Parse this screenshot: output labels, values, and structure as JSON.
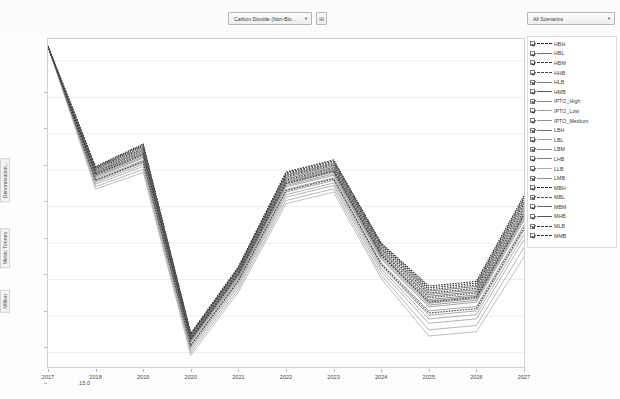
{
  "toolbar": {
    "dimension_filter": {
      "value": "Carbon Dioxide (Non-Biogenic)",
      "caret": "▼"
    },
    "dimension_button": {
      "icon": "⊞",
      "label": "filter-grid-button"
    },
    "scenario_filter": {
      "value": "All Scenarios",
      "caret": "▼"
    }
  },
  "chart_data": {
    "type": "line",
    "title": "",
    "xlabel": "",
    "ylabel": "Million | Metric Tonnes | Denomination...",
    "ylabel_parts": [
      "Denomination...",
      "Metric Tonnes",
      "Million"
    ],
    "x": [
      2017,
      2018,
      2019,
      2020,
      2021,
      2022,
      2023,
      2024,
      2025,
      2026,
      2027
    ],
    "xticks": [
      "2017",
      "2018",
      "2019",
      "2020",
      "2021",
      "2022",
      "2023",
      "2024",
      "2025",
      "2026",
      "2027"
    ],
    "yticks": [
      "15.0",
      "16.0",
      "17.0",
      "18.0",
      "19.0",
      "20.0",
      "21.0",
      "22.0",
      "23.0"
    ],
    "ylim": [
      14.6,
      23.6
    ],
    "xlim": [
      2017,
      2027
    ],
    "grid": true,
    "legend_position": "right",
    "series": [
      {
        "name": "HBH",
        "dash": "dotted",
        "color": "#2b2b2b",
        "values": [
          23.4,
          20.1,
          20.72,
          15.52,
          17.35,
          19.95,
          20.28,
          18.0,
          16.82,
          16.95,
          19.3
        ]
      },
      {
        "name": "HBL",
        "dash": "solid",
        "color": "#6f6f6f",
        "values": [
          23.4,
          19.92,
          20.48,
          15.38,
          17.18,
          19.7,
          20.02,
          17.72,
          16.45,
          16.58,
          18.85
        ]
      },
      {
        "name": "HBM",
        "dash": "dotted",
        "color": "#3a3a3a",
        "values": [
          23.4,
          20.02,
          20.6,
          15.45,
          17.27,
          19.83,
          20.15,
          17.86,
          16.63,
          16.76,
          19.08
        ]
      },
      {
        "name": "HHB",
        "dash": "dotted",
        "color": "#444444",
        "values": [
          23.4,
          20.06,
          20.66,
          15.49,
          17.31,
          19.89,
          20.21,
          17.93,
          16.72,
          16.85,
          19.18
        ]
      },
      {
        "name": "HLB",
        "dash": "solid",
        "color": "#7a7a7a",
        "values": [
          23.4,
          19.86,
          20.4,
          15.33,
          17.12,
          19.62,
          19.95,
          17.64,
          16.35,
          16.48,
          18.74
        ]
      },
      {
        "name": "HMB",
        "dash": "solid",
        "color": "#5a5a5a",
        "values": [
          23.4,
          19.96,
          20.54,
          15.41,
          17.22,
          19.76,
          20.08,
          17.79,
          16.54,
          16.67,
          18.96
        ]
      },
      {
        "name": "IPTO_High",
        "dash": "solid",
        "color": "#8a8a8a",
        "values": [
          23.4,
          19.8,
          20.33,
          15.28,
          17.05,
          19.54,
          19.86,
          17.55,
          16.25,
          16.38,
          18.62
        ]
      },
      {
        "name": "IPTO_Low",
        "dash": "solid",
        "color": "#9a9a9a",
        "values": [
          23.4,
          19.62,
          20.1,
          15.06,
          16.82,
          19.26,
          19.58,
          17.22,
          15.8,
          15.92,
          18.1
        ]
      },
      {
        "name": "IPTO_Medium",
        "dash": "solid",
        "color": "#909090",
        "values": [
          23.4,
          19.71,
          20.21,
          15.17,
          16.94,
          19.4,
          19.72,
          17.38,
          16.02,
          16.14,
          18.36
        ]
      },
      {
        "name": "LBH",
        "dash": "solid",
        "color": "#6a6a6a",
        "values": [
          23.4,
          19.9,
          20.45,
          15.36,
          17.16,
          19.67,
          19.99,
          17.69,
          16.41,
          16.54,
          18.8
        ]
      },
      {
        "name": "LBL",
        "dash": "solid",
        "color": "#9e9e9e",
        "values": [
          23.4,
          19.55,
          20.02,
          14.99,
          16.74,
          19.17,
          19.49,
          17.12,
          15.62,
          15.74,
          17.88
        ]
      },
      {
        "name": "LBM",
        "dash": "solid",
        "color": "#888888",
        "values": [
          23.4,
          19.76,
          20.27,
          15.22,
          17.0,
          19.47,
          19.79,
          17.46,
          16.14,
          16.26,
          18.49
        ]
      },
      {
        "name": "LHB",
        "dash": "solid",
        "color": "#7e7e7e",
        "values": [
          23.4,
          19.83,
          20.36,
          15.3,
          17.08,
          19.58,
          19.9,
          17.59,
          16.3,
          16.43,
          18.68
        ]
      },
      {
        "name": "LLB",
        "dash": "solid",
        "color": "#aaaaaa",
        "values": [
          23.4,
          19.48,
          19.94,
          14.92,
          16.66,
          19.08,
          19.4,
          17.03,
          15.45,
          15.57,
          17.62
        ]
      },
      {
        "name": "LMB",
        "dash": "solid",
        "color": "#949494",
        "values": [
          23.4,
          19.67,
          20.16,
          15.12,
          16.88,
          19.33,
          19.65,
          17.3,
          15.92,
          16.04,
          18.24
        ]
      },
      {
        "name": "MBH",
        "dash": "dotted",
        "color": "#313131",
        "values": [
          23.4,
          20.08,
          20.69,
          15.51,
          17.33,
          19.92,
          20.25,
          17.97,
          16.77,
          16.9,
          19.24
        ]
      },
      {
        "name": "MBL",
        "dash": "dotted",
        "color": "#4d4d4d",
        "values": [
          23.4,
          19.94,
          20.51,
          15.4,
          17.2,
          19.73,
          20.05,
          17.76,
          16.5,
          16.63,
          18.9
        ]
      },
      {
        "name": "MBM",
        "dash": "solid",
        "color": "#636363",
        "values": [
          23.4,
          19.99,
          20.57,
          15.43,
          17.25,
          19.8,
          20.12,
          17.83,
          16.59,
          16.72,
          19.02
        ]
      },
      {
        "name": "MHB",
        "dash": "solid",
        "color": "#585858",
        "values": [
          23.4,
          20.04,
          20.63,
          15.47,
          17.29,
          19.86,
          20.18,
          17.9,
          16.68,
          16.81,
          19.13
        ]
      },
      {
        "name": "MLB",
        "dash": "dotted",
        "color": "#3f3f3f",
        "values": [
          23.4,
          19.72,
          20.24,
          15.19,
          16.97,
          19.44,
          19.76,
          17.42,
          16.08,
          16.2,
          18.42
        ]
      },
      {
        "name": "MMB",
        "dash": "dotted",
        "color": "#353535",
        "values": [
          23.4,
          19.88,
          20.43,
          15.35,
          17.14,
          19.64,
          19.97,
          17.67,
          16.38,
          16.51,
          18.77
        ]
      }
    ]
  }
}
